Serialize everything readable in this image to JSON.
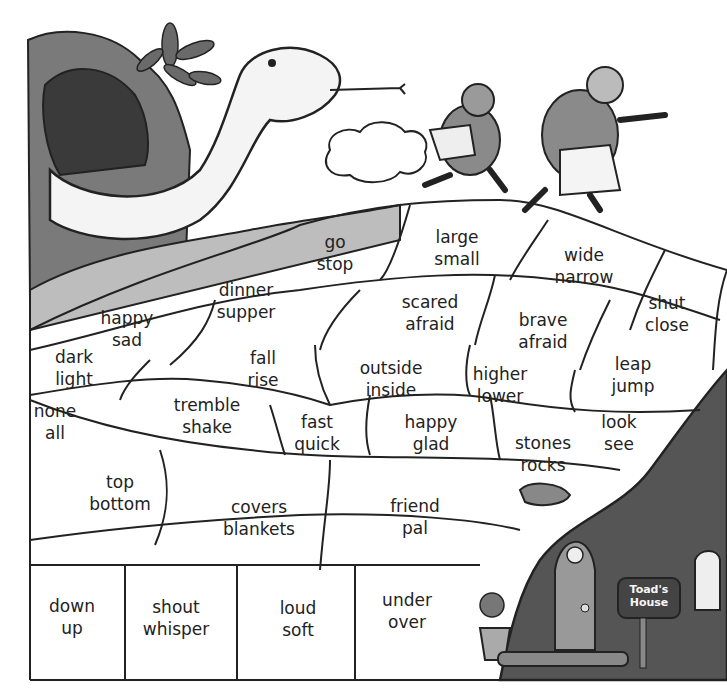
{
  "puzzle": {
    "pairs": [
      {
        "id": "go-stop",
        "a": "go",
        "b": "stop",
        "x": 335,
        "y": 253
      },
      {
        "id": "large-small",
        "a": "large",
        "b": "small",
        "x": 457,
        "y": 248
      },
      {
        "id": "wide-narrow",
        "a": "wide",
        "b": "narrow",
        "x": 584,
        "y": 266
      },
      {
        "id": "dinner-supper",
        "a": "dinner",
        "b": "supper",
        "x": 246,
        "y": 301
      },
      {
        "id": "scared-afraid",
        "a": "scared",
        "b": "afraid",
        "x": 430,
        "y": 313
      },
      {
        "id": "shut-close",
        "a": "shut",
        "b": "close",
        "x": 667,
        "y": 314
      },
      {
        "id": "happy-sad",
        "a": "happy",
        "b": "sad",
        "x": 127,
        "y": 329
      },
      {
        "id": "brave-afraid",
        "a": "brave",
        "b": "afraid",
        "x": 543,
        "y": 331
      },
      {
        "id": "dark-light",
        "a": "dark",
        "b": "light",
        "x": 74,
        "y": 368
      },
      {
        "id": "fall-rise",
        "a": "fall",
        "b": "rise",
        "x": 263,
        "y": 369
      },
      {
        "id": "outside-inside",
        "a": "outside",
        "b": "inside",
        "x": 391,
        "y": 379
      },
      {
        "id": "leap-jump",
        "a": "leap",
        "b": "jump",
        "x": 633,
        "y": 375
      },
      {
        "id": "higher-lower",
        "a": "higher",
        "b": "lower",
        "x": 500,
        "y": 385
      },
      {
        "id": "none-all",
        "a": "none",
        "b": "all",
        "x": 55,
        "y": 422
      },
      {
        "id": "tremble-shake",
        "a": "tremble",
        "b": "shake",
        "x": 207,
        "y": 416
      },
      {
        "id": "fast-quick",
        "a": "fast",
        "b": "quick",
        "x": 317,
        "y": 433
      },
      {
        "id": "happy-glad",
        "a": "happy",
        "b": "glad",
        "x": 431,
        "y": 433
      },
      {
        "id": "look-see",
        "a": "look",
        "b": "see",
        "x": 619,
        "y": 433
      },
      {
        "id": "stones-rocks",
        "a": "stones",
        "b": "rocks",
        "x": 543,
        "y": 454
      },
      {
        "id": "top-bottom",
        "a": "top",
        "b": "bottom",
        "x": 120,
        "y": 493
      },
      {
        "id": "covers-blankets",
        "a": "covers",
        "b": "blankets",
        "x": 259,
        "y": 518
      },
      {
        "id": "friend-pal",
        "a": "friend",
        "b": "pal",
        "x": 415,
        "y": 517
      },
      {
        "id": "down-up",
        "a": "down",
        "b": "up",
        "x": 72,
        "y": 617
      },
      {
        "id": "shout-whisper",
        "a": "shout",
        "b": "whisper",
        "x": 176,
        "y": 618
      },
      {
        "id": "loud-soft",
        "a": "loud",
        "b": "soft",
        "x": 298,
        "y": 619
      },
      {
        "id": "under-over",
        "a": "under",
        "b": "over",
        "x": 407,
        "y": 611
      }
    ]
  },
  "scene": {
    "mailbox_label_line1": "Toad's",
    "mailbox_label_line2": "House"
  }
}
